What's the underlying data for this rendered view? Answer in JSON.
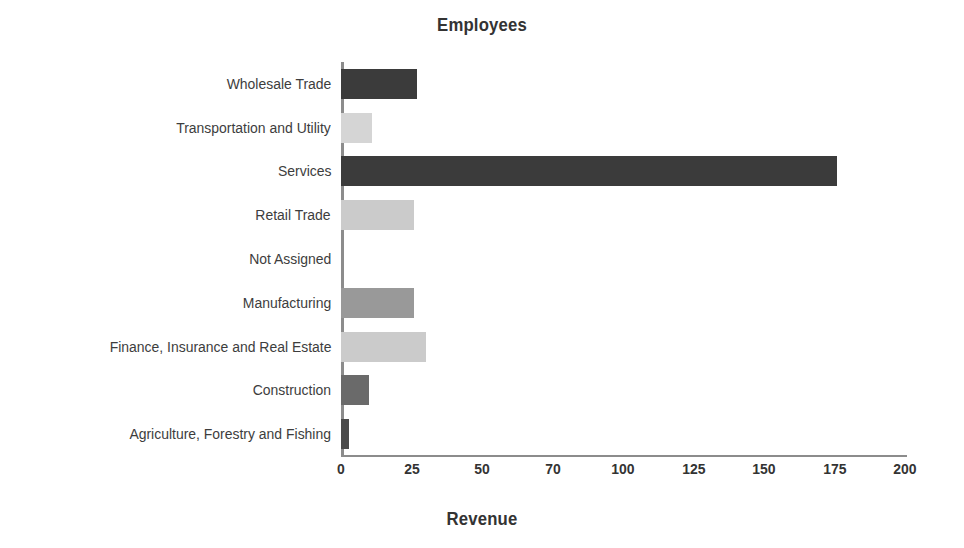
{
  "chart_data": {
    "type": "bar",
    "orientation": "horizontal",
    "title": "Employees",
    "xlabel": "Revenue",
    "ylabel": "",
    "xlim": [
      0,
      200
    ],
    "grid": false,
    "legend": null,
    "xticks": [
      "0",
      "25",
      "50",
      "70",
      "100",
      "125",
      "150",
      "175",
      "200"
    ],
    "xtick_values": [
      0,
      25,
      50,
      75,
      100,
      125,
      150,
      175,
      200
    ],
    "categories": [
      "Wholesale Trade",
      "Transportation and Utility",
      "Services",
      "Retail Trade",
      "Not Assigned",
      "Manufacturing",
      "Finance, Insurance and Real Estate",
      "Construction",
      "Agriculture, Forestry and Fishing"
    ],
    "values": [
      27,
      11,
      176,
      26,
      0,
      26,
      30,
      10,
      3
    ],
    "bar_colors": [
      "#3b3b3b",
      "#d5d5d5",
      "#3b3b3b",
      "#cbcbcb",
      "#ffffff",
      "#999999",
      "#cbcbcb",
      "#6a6a6a",
      "#4a4a4a"
    ]
  },
  "figure": {
    "background": "#ffffff",
    "axis_color": "#8c8c8c",
    "text_color": "#3a3a3a"
  }
}
